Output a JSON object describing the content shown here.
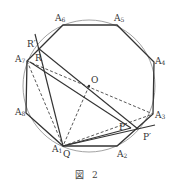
{
  "figure": {
    "caption_prefix": "図",
    "caption_number": "2"
  },
  "colors": {
    "stroke": "#333333",
    "circle": "#888888",
    "background": "#ffffff"
  },
  "points": {
    "A1": {
      "label": "A",
      "sub": "1"
    },
    "A2": {
      "label": "A",
      "sub": "2"
    },
    "A3": {
      "label": "A",
      "sub": "3"
    },
    "A4": {
      "label": "A",
      "sub": "4"
    },
    "A5": {
      "label": "A",
      "sub": "5"
    },
    "A6": {
      "label": "A",
      "sub": "6"
    },
    "A7": {
      "label": "A",
      "sub": "7"
    },
    "A8": {
      "label": "A",
      "sub": "8"
    },
    "O": {
      "label": "O"
    },
    "P": {
      "label": "P"
    },
    "P_prime": {
      "label": "P′"
    },
    "Q": {
      "label": "Q"
    },
    "R": {
      "label": "R"
    },
    "R_prime": {
      "label": "R′"
    }
  }
}
